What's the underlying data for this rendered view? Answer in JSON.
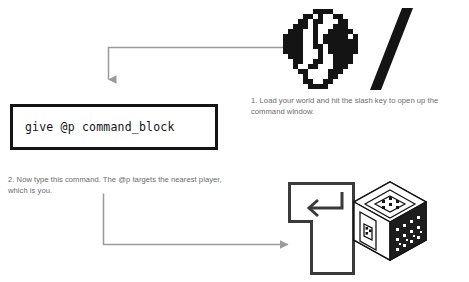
{
  "meta": {
    "background_color": "#ffffff",
    "ink_color": "#141414",
    "caption_color": "#6b6b6b",
    "arrow_color": "#9a9a9a"
  },
  "command_box": {
    "command": "give @p command_block",
    "border_color": "#141414",
    "fill_color": "#ffffff"
  },
  "steps": [
    {
      "number": "1.",
      "text": "1. Load your world and hit the slash key to open up the command window."
    },
    {
      "number": "2.",
      "text": "2. Now type this command. The @p targets the nearest player, which is you."
    }
  ],
  "icons": {
    "globe": "globe-icon",
    "slash": "slash-key-icon",
    "enter": "enter-key-icon",
    "command_block": "command-block-cube-icon"
  },
  "arrows": [
    {
      "name": "arrow-globe-to-command-box",
      "direction": "down"
    },
    {
      "name": "arrow-command-box-to-enter-key",
      "direction": "right"
    }
  ]
}
